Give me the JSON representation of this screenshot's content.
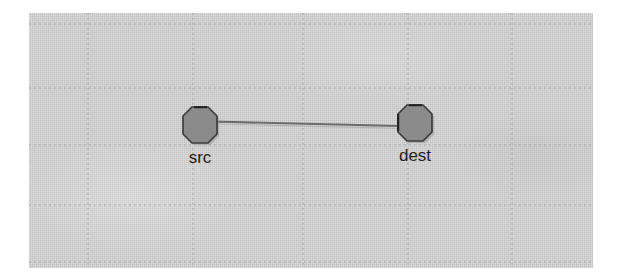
{
  "canvas": {
    "name": "graph-canvas",
    "background_color": "#c9c9c9",
    "grid": {
      "visible": true,
      "style": "dotted",
      "color": "#a9a9a9",
      "vertical_lines": [
        59,
        164,
        274,
        379,
        483
      ],
      "horizontal_lines": [
        11,
        75,
        132,
        192,
        249
      ],
      "spacing_x": 105,
      "spacing_y": 58
    }
  },
  "graph": {
    "type": "node-link-diagram",
    "nodes": [
      {
        "id": "src",
        "label": "src",
        "shape": "octagon",
        "x": 171,
        "y": 112,
        "width": 38,
        "height": 38,
        "fill_color": "#8c8c8c",
        "stroke_color": "#404040",
        "label_position": "below"
      },
      {
        "id": "dest",
        "label": "dest",
        "shape": "octagon",
        "x": 386,
        "y": 110,
        "width": 38,
        "height": 38,
        "fill_color": "#8c8c8c",
        "stroke_color": "#404040",
        "label_position": "below"
      }
    ],
    "edges": [
      {
        "id": "src-dest",
        "from": "src",
        "to": "dest",
        "directed": false,
        "stroke_color": "#6e6e6e",
        "label": ""
      }
    ]
  }
}
